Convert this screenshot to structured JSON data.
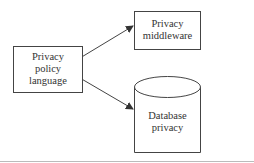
{
  "diagram": {
    "nodes": [
      {
        "id": "privacy-policy-language",
        "shape": "rectangle",
        "lines": [
          "Privacy",
          "policy",
          "language"
        ]
      },
      {
        "id": "privacy-middleware",
        "shape": "rectangle",
        "lines": [
          "Privacy",
          "middleware"
        ]
      },
      {
        "id": "database-privacy",
        "shape": "cylinder",
        "lines": [
          "Database",
          "privacy"
        ]
      }
    ],
    "edges": [
      {
        "from": "privacy-policy-language",
        "to": "privacy-middleware",
        "type": "arrow"
      },
      {
        "from": "privacy-policy-language",
        "to": "database-privacy",
        "type": "arrow"
      }
    ],
    "colors": {
      "stroke": "#444444",
      "text": "#333333",
      "footer_rule": "#bbbbbb"
    }
  }
}
